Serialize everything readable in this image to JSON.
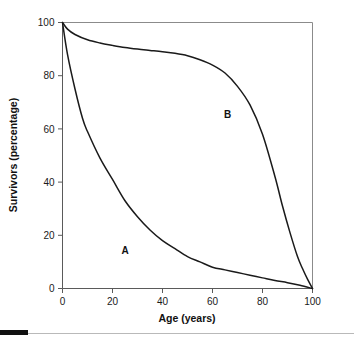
{
  "chart_data": {
    "type": "line",
    "title": "",
    "xlabel": "Age (years)",
    "ylabel": "Survivors (percentage)",
    "xlim": [
      0,
      100
    ],
    "ylim": [
      0,
      100
    ],
    "xticks": [
      "0",
      "20",
      "40",
      "60",
      "80",
      "100"
    ],
    "yticks": [
      "0",
      "20",
      "40",
      "60",
      "80",
      "100"
    ],
    "grid": false,
    "legend_position": "inline-annotations",
    "series": [
      {
        "name": "A",
        "label": "A",
        "label_x": 25,
        "label_y": 13,
        "color": "#1a1a1a",
        "x": [
          0,
          2,
          5,
          8,
          10,
          15,
          20,
          25,
          30,
          35,
          40,
          45,
          50,
          55,
          60,
          65,
          70,
          75,
          80,
          85,
          90,
          95,
          100
        ],
        "values": [
          100,
          88,
          75,
          64,
          59,
          49,
          41,
          33,
          27,
          22,
          18,
          15,
          12,
          10,
          8,
          7,
          6,
          5,
          4,
          3,
          2.2,
          1.2,
          0
        ]
      },
      {
        "name": "B",
        "label": "B",
        "label_x": 66,
        "label_y": 64,
        "color": "#1a1a1a",
        "x": [
          0,
          2,
          5,
          10,
          15,
          20,
          25,
          30,
          35,
          40,
          45,
          50,
          55,
          60,
          65,
          70,
          75,
          80,
          85,
          88,
          91,
          94,
          96,
          98,
          100
        ],
        "values": [
          100,
          97.5,
          95.5,
          93.5,
          92.3,
          91.4,
          90.6,
          90,
          89.5,
          89,
          88.4,
          87.5,
          86,
          84,
          81,
          76,
          69,
          58,
          42,
          31,
          21,
          12,
          7.5,
          3.5,
          0
        ]
      }
    ],
    "annotations": [
      {
        "text": "A",
        "x": 25,
        "y": 13
      },
      {
        "text": "B",
        "x": 66,
        "y": 64
      }
    ]
  },
  "footer": {
    "bar_present": true,
    "rule_present": true
  }
}
